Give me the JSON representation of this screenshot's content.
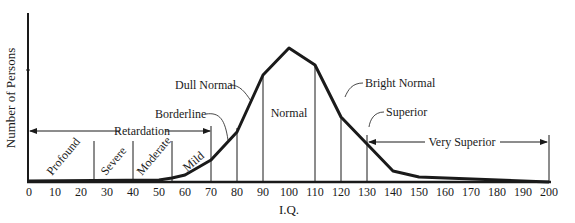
{
  "chart_data": {
    "type": "line",
    "title": "",
    "xlabel": "I.Q.",
    "ylabel": "Number of Persons",
    "xlim": [
      0,
      200
    ],
    "x_ticks": [
      0,
      10,
      20,
      30,
      40,
      50,
      60,
      70,
      80,
      90,
      100,
      110,
      120,
      130,
      140,
      150,
      160,
      170,
      180,
      190,
      200
    ],
    "grid": false,
    "series": [
      {
        "name": "IQ distribution",
        "x": [
          0,
          50,
          55,
          60,
          70,
          80,
          90,
          100,
          110,
          120,
          130,
          140,
          150,
          200
        ],
        "y_relative": [
          0.3,
          1,
          2.5,
          4.5,
          13,
          29,
          63,
          79,
          70,
          38,
          22,
          6,
          2.5,
          0
        ]
      }
    ],
    "regions": [
      {
        "label": "Profound",
        "from": 0,
        "to": 25
      },
      {
        "label": "Severe",
        "from": 25,
        "to": 40
      },
      {
        "label": "Moderate",
        "from": 40,
        "to": 55
      },
      {
        "label": "Mild",
        "from": 55,
        "to": 70
      },
      {
        "label": "Borderline",
        "from": 70,
        "to": 80
      },
      {
        "label": "Dull Normal",
        "from": 80,
        "to": 90
      },
      {
        "label": "Normal",
        "from": 90,
        "to": 110
      },
      {
        "label": "Bright Normal",
        "from": 110,
        "to": 120
      },
      {
        "label": "Superior",
        "from": 120,
        "to": 130
      },
      {
        "label": "Very Superior",
        "from": 130,
        "to": 200
      }
    ],
    "spans": [
      {
        "label": "Retardation",
        "from": 0,
        "to": 70
      },
      {
        "label": "Very Superior",
        "from": 130,
        "to": 200
      }
    ]
  },
  "labels": {
    "ylabel": "Number of Persons",
    "xlabel": "I.Q.",
    "retardation": "Retardation",
    "very_superior": "Very Superior",
    "profound": "Profound",
    "severe": "Severe",
    "moderate": "Moderate",
    "mild": "Mild",
    "borderline": "Borderline",
    "dull_normal": "Dull Normal",
    "normal": "Normal",
    "bright_normal": "Bright Normal",
    "superior": "Superior"
  },
  "ticks": [
    "0",
    "10",
    "20",
    "30",
    "40",
    "50",
    "60",
    "70",
    "80",
    "90",
    "100",
    "110",
    "120",
    "130",
    "140",
    "150",
    "160",
    "170",
    "180",
    "190",
    "200"
  ]
}
